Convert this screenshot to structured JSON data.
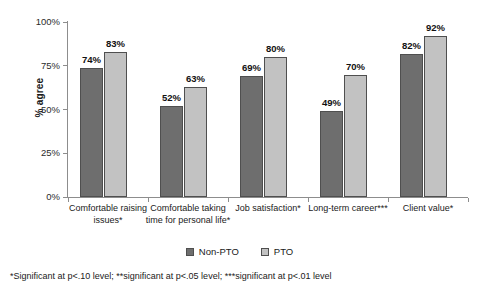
{
  "chart_data": {
    "type": "bar",
    "title": "",
    "subtitle": "",
    "xlabel": "",
    "ylabel": "% agree",
    "ylim": [
      0,
      100
    ],
    "grid": false,
    "legend_position": "bottom-center",
    "y_ticks": [
      "0%",
      "25%",
      "50%",
      "75%",
      "100%"
    ],
    "y_tick_values": [
      0,
      25,
      50,
      75,
      100
    ],
    "categories": [
      "Comfortable raising issues*",
      "Comfortable taking time for personal life*",
      "Job satisfaction*",
      "Long-term career***",
      "Client value*"
    ],
    "series": [
      {
        "name": "Non-PTO",
        "color": "#6e6e6e",
        "values": [
          74,
          52,
          69,
          49,
          82
        ],
        "labels": [
          "74%",
          "52%",
          "69%",
          "49%",
          "82%"
        ]
      },
      {
        "name": "PTO",
        "color": "#c2c2c2",
        "values": [
          83,
          63,
          80,
          70,
          92
        ],
        "labels": [
          "83%",
          "63%",
          "80%",
          "70%",
          "92%"
        ]
      }
    ]
  },
  "legend": {
    "items": [
      {
        "label": "Non-PTO",
        "color": "#6e6e6e"
      },
      {
        "label": "PTO",
        "color": "#c2c2c2"
      }
    ]
  },
  "footnote": "*Significant at p<.10 level; **significant at p<.05 level; ***significant at p<.01 level"
}
